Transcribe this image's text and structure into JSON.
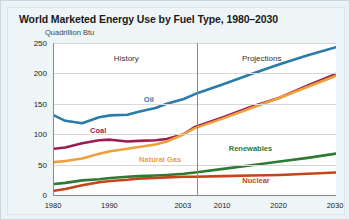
{
  "chart_data": {
    "type": "line",
    "title": "World Marketed Energy Use by Fuel Type, 1980–2030",
    "subtitle": "Quadrillion Btu",
    "ylabel": "Quadrillion Btu",
    "xlabel": "",
    "ylim": [
      0,
      250
    ],
    "xlim": [
      1980,
      2030
    ],
    "grid": true,
    "legend_position": "inline-annotations",
    "ytick_labels": [
      "0",
      "50",
      "100",
      "150",
      "200",
      "250"
    ],
    "ytick_values": [
      0,
      50,
      100,
      150,
      200,
      250
    ],
    "xtick_labels": [
      "1980",
      "1990",
      "2003",
      "2010",
      "2020",
      "2030"
    ],
    "xtick_values": [
      1980,
      1990,
      2003,
      2010,
      2020,
      2030
    ],
    "region_divider_year": 2003,
    "region_labels": [
      {
        "text": "History",
        "year": 1993,
        "value": 232
      },
      {
        "text": "Projections",
        "year": 2017,
        "value": 232
      }
    ],
    "x": [
      1980,
      1982,
      1985,
      1988,
      1990,
      1993,
      1995,
      1998,
      2000,
      2003,
      2005,
      2010,
      2015,
      2020,
      2025,
      2030
    ],
    "series": [
      {
        "name": "Oil",
        "color": "#2b7ba8",
        "label_year": 1997,
        "label_value": 158,
        "values": [
          131,
          122,
          118,
          128,
          131,
          132,
          137,
          143,
          150,
          158,
          166,
          182,
          199,
          215,
          230,
          243
        ]
      },
      {
        "name": "Coal",
        "color": "#9e1b4f",
        "label_year": 1988,
        "label_value": 107,
        "values": [
          76,
          78,
          85,
          90,
          91,
          88,
          89,
          90,
          92,
          100,
          112,
          128,
          145,
          160,
          180,
          199
        ]
      },
      {
        "name": "Natural Gas",
        "color": "#eda03a",
        "label_year": 1999,
        "label_value": 60,
        "values": [
          54,
          56,
          60,
          68,
          72,
          76,
          79,
          83,
          88,
          100,
          110,
          126,
          143,
          160,
          178,
          196
        ]
      },
      {
        "name": "Renewables",
        "color": "#2d7a32",
        "label_year": 2015,
        "label_value": 77,
        "values": [
          18,
          20,
          24,
          26,
          28,
          30,
          31,
          32,
          33,
          35,
          37,
          43,
          49,
          55,
          61,
          68
        ]
      },
      {
        "name": "Nuclear",
        "color": "#c4441c",
        "label_year": 2016,
        "label_value": 24,
        "values": [
          7,
          10,
          16,
          21,
          23,
          25,
          27,
          28,
          29,
          30,
          30,
          31,
          32,
          33,
          35,
          37
        ]
      }
    ]
  }
}
